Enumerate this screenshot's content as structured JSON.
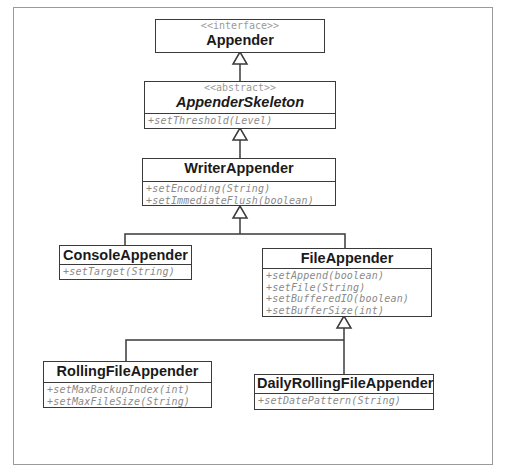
{
  "diagram": {
    "type": "uml-class-hierarchy",
    "classes": [
      {
        "id": "appender",
        "stereotype": "<<interface>>",
        "name": "Appender",
        "abstract": false,
        "operations": []
      },
      {
        "id": "appender_skeleton",
        "stereotype": "<<abstract>>",
        "name": "AppenderSkeleton",
        "abstract": true,
        "operations": [
          "+setThreshold(Level)"
        ]
      },
      {
        "id": "writer_appender",
        "stereotype": "",
        "name": "WriterAppender",
        "abstract": false,
        "operations": [
          "+setEncoding(String)",
          "+setImmediateFlush(boolean)"
        ]
      },
      {
        "id": "console_appender",
        "stereotype": "",
        "name": "ConsoleAppender",
        "abstract": false,
        "operations": [
          "+setTarget(String)"
        ]
      },
      {
        "id": "file_appender",
        "stereotype": "",
        "name": "FileAppender",
        "abstract": false,
        "operations": [
          "+setAppend(boolean)",
          "+setFile(String)",
          "+setBufferedIO(boolean)",
          "+setBufferSize(int)"
        ]
      },
      {
        "id": "rolling_file_appender",
        "stereotype": "",
        "name": "RollingFileAppender",
        "abstract": false,
        "operations": [
          "+setMaxBackupIndex(int)",
          "+setMaxFileSize(String)"
        ]
      },
      {
        "id": "daily_rolling_file_appender",
        "stereotype": "",
        "name": "DailyRollingFileAppender",
        "abstract": false,
        "operations": [
          "+setDatePattern(String)"
        ]
      }
    ],
    "relations": [
      {
        "type": "generalization",
        "child": "AppenderSkeleton",
        "parent": "Appender"
      },
      {
        "type": "generalization",
        "child": "WriterAppender",
        "parent": "AppenderSkeleton"
      },
      {
        "type": "generalization",
        "child": "ConsoleAppender",
        "parent": "WriterAppender"
      },
      {
        "type": "generalization",
        "child": "FileAppender",
        "parent": "WriterAppender"
      },
      {
        "type": "generalization",
        "child": "RollingFileAppender",
        "parent": "FileAppender"
      },
      {
        "type": "generalization",
        "child": "DailyRollingFileAppender",
        "parent": "FileAppender"
      }
    ],
    "colors": {
      "line": "#3a3a3a",
      "stereotype_text": "#9a9a9a",
      "operation_text": "#8a8a8a",
      "frame": "#9a9a9a"
    }
  }
}
